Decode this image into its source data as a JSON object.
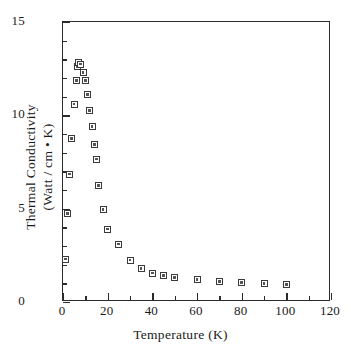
{
  "chart_data": {
    "type": "scatter",
    "title": "",
    "xlabel": "Temperature (K)",
    "ylabel_line1": "Thermal Conductivity",
    "ylabel_line2": "(Watt / cm • K)",
    "xlim": [
      0,
      120
    ],
    "ylim": [
      0,
      15
    ],
    "xticks": [
      0,
      20,
      40,
      60,
      80,
      100,
      120
    ],
    "xticklabels": [
      "0",
      "20",
      "40",
      "60",
      "80",
      "100",
      "120"
    ],
    "xminor_step": 10,
    "yticks": [
      0,
      5,
      10,
      15
    ],
    "yticklabels": [
      "0",
      "5",
      "10",
      "15"
    ],
    "yminor_step": 1,
    "grid": false,
    "legend": false,
    "marker": "open-square-with-dot",
    "marker_color": "#3a3a3a",
    "series": [
      {
        "name": "Thermal conductivity",
        "x": [
          1,
          2,
          3,
          4,
          5,
          6,
          6.5,
          7,
          8,
          9,
          10,
          11,
          12,
          13,
          14,
          15,
          16,
          18,
          20,
          25,
          30,
          35,
          40,
          45,
          50,
          60,
          70,
          80,
          90,
          100
        ],
        "y": [
          2.3,
          4.75,
          6.85,
          8.75,
          10.6,
          11.85,
          12.6,
          12.85,
          12.75,
          12.3,
          11.85,
          11.1,
          10.25,
          9.4,
          8.45,
          7.65,
          6.25,
          4.95,
          3.9,
          3.1,
          2.25,
          1.8,
          1.55,
          1.4,
          1.3,
          1.2,
          1.1,
          1.05,
          0.98,
          0.95
        ]
      }
    ]
  },
  "axis": {
    "x_title": "Temperature (K)",
    "y_title_line1": "Thermal Conductivity",
    "y_title_line2": "(Watt / cm • K)"
  }
}
